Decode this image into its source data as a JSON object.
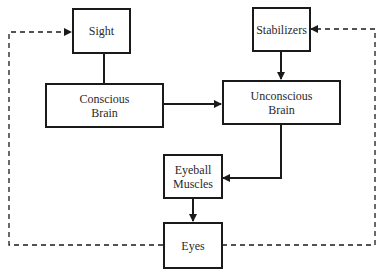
{
  "diagram": {
    "type": "flowchart",
    "nodes": {
      "sight": {
        "line1": "Sight",
        "line2": ""
      },
      "stabilizers": {
        "line1": "Stabilizers",
        "line2": ""
      },
      "conscious_brain": {
        "line1": "Conscious",
        "line2": "Brain"
      },
      "unconscious_brain": {
        "line1": "Unconscious",
        "line2": "Brain"
      },
      "eyeball_muscles": {
        "line1": "Eyeball",
        "line2": "Muscles"
      },
      "eyes": {
        "line1": "Eyes",
        "line2": ""
      }
    },
    "edges": [
      {
        "from": "Sight",
        "to": "Conscious Brain",
        "style": "solid",
        "arrow": false
      },
      {
        "from": "Conscious Brain",
        "to": "Unconscious Brain",
        "style": "solid",
        "arrow": true
      },
      {
        "from": "Stabilizers",
        "to": "Unconscious Brain",
        "style": "solid",
        "arrow": true
      },
      {
        "from": "Unconscious Brain",
        "to": "Eyeball Muscles",
        "style": "solid",
        "arrow": true
      },
      {
        "from": "Eyeball Muscles",
        "to": "Eyes",
        "style": "solid",
        "arrow": true
      },
      {
        "from": "Eyes",
        "to": "Sight",
        "style": "dashed",
        "arrow": true
      },
      {
        "from": "Eyes",
        "to": "Stabilizers",
        "style": "dashed",
        "arrow": true
      }
    ],
    "colors": {
      "line": "#1a1a1a",
      "text": "#2a2a2a",
      "background": "#ffffff"
    }
  }
}
